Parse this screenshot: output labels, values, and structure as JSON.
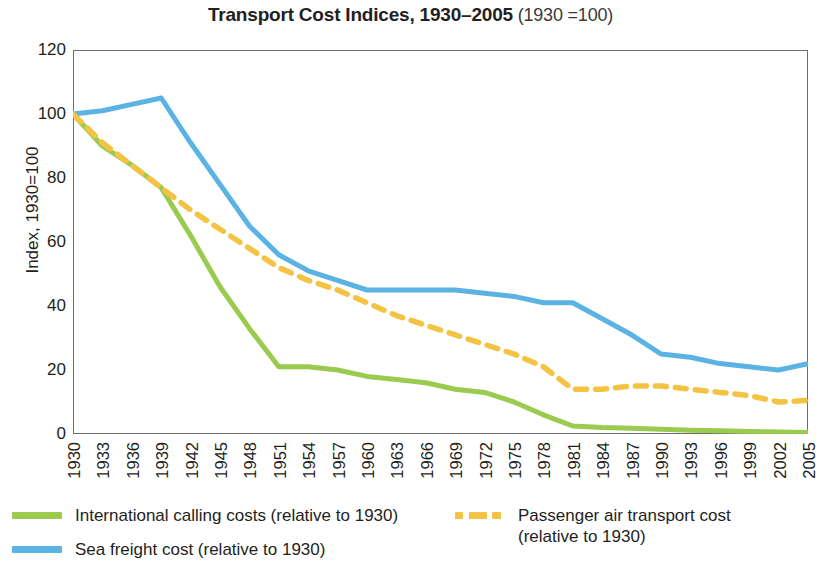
{
  "title": {
    "main": "Transport Cost Indices, 1930–2005",
    "sub": " (1930 =100)"
  },
  "axes": {
    "y_title": "Index, 1930=100",
    "y_ticks": [
      "0",
      "20",
      "40",
      "60",
      "80",
      "100",
      "120"
    ],
    "x_ticks": [
      "1930",
      "1933",
      "1936",
      "1939",
      "1942",
      "1945",
      "1948",
      "1951",
      "1954",
      "1957",
      "1960",
      "1963",
      "1966",
      "1969",
      "1972",
      "1975",
      "1978",
      "1981",
      "1984",
      "1987",
      "1990",
      "1993",
      "1996",
      "1999",
      "2002",
      "2005"
    ]
  },
  "legend": {
    "items": [
      {
        "key": "calling",
        "label": "International calling costs (relative to 1930)",
        "color": "#9ACB4F",
        "style": "solid"
      },
      {
        "key": "sea",
        "label": "Sea freight cost (relative to 1930)",
        "color": "#5BB3E4",
        "style": "solid"
      },
      {
        "key": "air",
        "label": "Passenger air transport cost\n(relative to 1930)",
        "color": "#F5C344",
        "style": "dashed"
      }
    ]
  },
  "chart_data": {
    "type": "line",
    "title": "Transport Cost Indices, 1930–2005 (1930 =100)",
    "xlabel": "",
    "ylabel": "Index, 1930=100",
    "xlim": [
      1930,
      2005
    ],
    "ylim": [
      0,
      120
    ],
    "yticks": [
      0,
      20,
      40,
      60,
      80,
      100,
      120
    ],
    "xticks": [
      1930,
      1933,
      1936,
      1939,
      1942,
      1945,
      1948,
      1951,
      1954,
      1957,
      1960,
      1963,
      1966,
      1969,
      1972,
      1975,
      1978,
      1981,
      1984,
      1987,
      1990,
      1993,
      1996,
      1999,
      2002,
      2005
    ],
    "grid": false,
    "legend_position": "below",
    "series": [
      {
        "name": "International calling costs (relative to 1930)",
        "color": "#9ACB4F",
        "style": "solid",
        "x": [
          1930,
          1933,
          1936,
          1939,
          1942,
          1945,
          1948,
          1951,
          1954,
          1957,
          1960,
          1963,
          1966,
          1969,
          1972,
          1975,
          1978,
          1981,
          1984,
          1987,
          1990,
          1993,
          1996,
          1999,
          2002,
          2005
        ],
        "y": [
          100,
          90,
          84,
          77,
          62,
          46,
          33,
          21,
          21,
          20,
          18,
          17,
          16,
          14,
          13,
          10,
          6,
          2.5,
          2,
          1.8,
          1.5,
          1.2,
          1,
          0.8,
          0.6,
          0.5
        ]
      },
      {
        "name": "Sea freight cost (relative to 1930)",
        "color": "#5BB3E4",
        "style": "solid",
        "x": [
          1930,
          1933,
          1936,
          1939,
          1942,
          1945,
          1948,
          1951,
          1954,
          1957,
          1960,
          1963,
          1966,
          1969,
          1972,
          1975,
          1978,
          1981,
          1984,
          1987,
          1990,
          1993,
          1996,
          1999,
          2002,
          2005
        ],
        "y": [
          100,
          101,
          103,
          105,
          91,
          78,
          65,
          56,
          51,
          48,
          45,
          45,
          45,
          45,
          44,
          43,
          41,
          41,
          36,
          31,
          25,
          24,
          22,
          21,
          20,
          22
        ]
      },
      {
        "name": "Passenger air transport cost (relative to 1930)",
        "color": "#F5C344",
        "style": "dashed",
        "x": [
          1930,
          1933,
          1936,
          1939,
          1942,
          1945,
          1948,
          1951,
          1954,
          1957,
          1960,
          1963,
          1966,
          1969,
          1972,
          1975,
          1978,
          1981,
          1984,
          1987,
          1990,
          1993,
          1996,
          1999,
          2002,
          2005
        ],
        "y": [
          100,
          91,
          84,
          77,
          70,
          64,
          58,
          52,
          48,
          45,
          41,
          37,
          34,
          31,
          28,
          25,
          21,
          14,
          14,
          15,
          15,
          14,
          13,
          12,
          10,
          10.5
        ]
      }
    ]
  }
}
